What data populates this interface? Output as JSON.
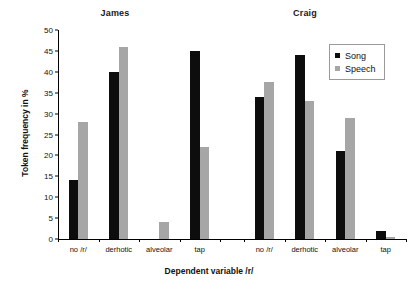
{
  "chart_data": {
    "type": "bar",
    "title": "",
    "xlabel": "Dependent variable /r/",
    "ylabel": "Token frequency in %",
    "ylim": [
      0,
      50
    ],
    "yticks": [
      0,
      5,
      10,
      15,
      20,
      25,
      30,
      35,
      40,
      45,
      50
    ],
    "grid": false,
    "legend_position": "top-right",
    "legend": [
      "Song",
      "Speech"
    ],
    "categories": [
      "no /r/",
      "derhotic",
      "alveolar",
      "tap"
    ],
    "groups": [
      {
        "name": "James",
        "series": [
          {
            "name": "Song",
            "color": "#0d0d0d",
            "values": [
              14,
              40,
              0,
              45
            ]
          },
          {
            "name": "Speech",
            "color": "#a6a6a6",
            "values": [
              28,
              46,
              4,
              22
            ]
          }
        ]
      },
      {
        "name": "Craig",
        "series": [
          {
            "name": "Song",
            "color": "#0d0d0d",
            "values": [
              34,
              44,
              21,
              2
            ]
          },
          {
            "name": "Speech",
            "color": "#a6a6a6",
            "values": [
              37.5,
              33,
              29,
              0.5
            ]
          }
        ]
      }
    ]
  },
  "colors": {
    "song": "#0d0d0d",
    "speech": "#a6a6a6",
    "axis": "#000000",
    "background": "#ffffff"
  }
}
